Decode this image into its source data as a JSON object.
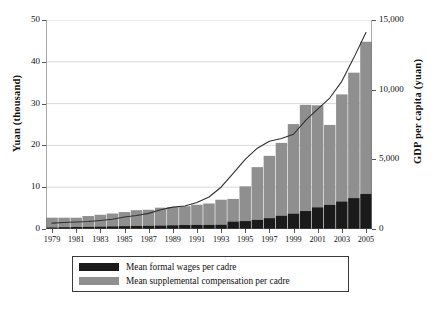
{
  "chart_data": {
    "type": "bar",
    "title": "",
    "subtitle": "",
    "xlabel": "",
    "ylabel": "Yuan (thousand)",
    "y2label": "GDP per capita (yuan)",
    "grid": true,
    "legend_position": "bottom",
    "ylim": [
      0,
      50
    ],
    "y2lim": [
      0,
      15000
    ],
    "yticks": [
      "0",
      "10",
      "20",
      "30",
      "40",
      "50"
    ],
    "ytick_values": [
      0,
      10,
      20,
      30,
      40,
      50
    ],
    "y2ticks": [
      "0",
      "5,000",
      "10,000",
      "15,000"
    ],
    "y2tick_values": [
      0,
      5000,
      10000,
      15000
    ],
    "x": [
      1979,
      1980,
      1981,
      1982,
      1983,
      1984,
      1985,
      1986,
      1987,
      1988,
      1989,
      1990,
      1991,
      1992,
      1993,
      1994,
      1995,
      1996,
      1997,
      1998,
      1999,
      2000,
      2001,
      2002,
      2003,
      2004,
      2005
    ],
    "xticks": [
      "1979",
      "1981",
      "1983",
      "1985",
      "1987",
      "1989",
      "1991",
      "1993",
      "1995",
      "1997",
      "1999",
      "2001",
      "2003",
      "2005"
    ],
    "xtick_values": [
      1979,
      1981,
      1983,
      1985,
      1987,
      1989,
      1991,
      1993,
      1995,
      1997,
      1999,
      2001,
      2003,
      2005
    ],
    "stacked": true,
    "colors": {
      "formal_wages": "#1a1a1a",
      "supplemental": "#8f8f8f",
      "gdp_line": "#303030",
      "grid": "#c8c8c8",
      "axis": "#555555"
    },
    "series": [
      {
        "name": "Mean formal wages per cadre",
        "key": "formal_wages",
        "axis": "left",
        "color": "#1a1a1a",
        "values": [
          0.4,
          0.45,
          0.5,
          0.55,
          0.6,
          0.65,
          0.7,
          0.75,
          0.8,
          0.85,
          0.9,
          0.95,
          1.0,
          1.0,
          1.05,
          1.8,
          1.9,
          2.2,
          2.6,
          3.2,
          3.7,
          4.3,
          5.2,
          5.8,
          6.6,
          7.4,
          8.4
        ]
      },
      {
        "name": "Mean supplemental compensation per cadre",
        "key": "supplemental",
        "axis": "left",
        "color": "#8f8f8f",
        "values": [
          2.3,
          2.25,
          2.2,
          2.55,
          2.8,
          3.05,
          3.35,
          3.75,
          3.8,
          4.25,
          4.35,
          4.5,
          4.8,
          5.1,
          5.95,
          5.4,
          8.3,
          12.6,
          14.9,
          17.4,
          21.4,
          25.4,
          24.4,
          19.1,
          25.6,
          30.0,
          36.4
        ]
      }
    ],
    "line_series": {
      "name": "GDP per capita (yuan)",
      "key": "gdp_per_capita",
      "axis": "right",
      "color": "#303030",
      "values": [
        420,
        470,
        500,
        540,
        610,
        700,
        860,
        970,
        1120,
        1380,
        1570,
        1650,
        1900,
        2300,
        3000,
        4000,
        5000,
        5800,
        6300,
        6500,
        6800,
        7800,
        8600,
        9400,
        10600,
        12300,
        14100
      ]
    }
  },
  "legend": {
    "items": [
      {
        "label": "Mean formal wages per cadre",
        "color": "#1a1a1a"
      },
      {
        "label": "Mean supplemental compensation per cadre",
        "color": "#8f8f8f"
      }
    ]
  }
}
